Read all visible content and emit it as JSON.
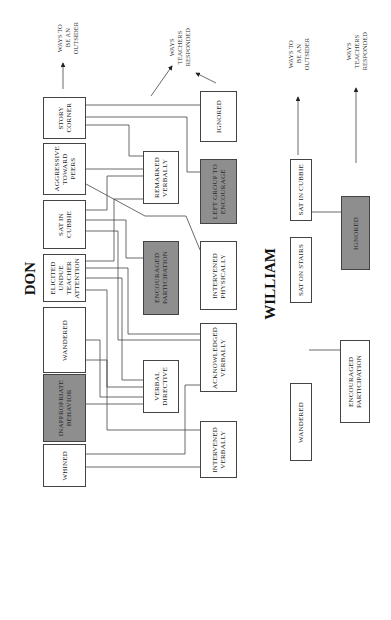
{
  "don": {
    "title": "DON",
    "caption_outsider": "WAYS TO\nBE AN\nOUTSIDER",
    "caption_teachers": "WAYS\nTEACHERS\nRESPONDED",
    "behaviors": [
      {
        "label": "STORY\nCORNER",
        "shaded": false
      },
      {
        "label": "AGGRESSIVE\nTOWARD\nPEERS",
        "shaded": false
      },
      {
        "label": "SAT IN\nCUBBIE",
        "shaded": false
      },
      {
        "label": "ELICITED\nUNDUE\nTEACHER\nATTENTION",
        "shaded": false
      },
      {
        "label": "WANDERED",
        "shaded": false
      },
      {
        "label": "INAPPROPRIATE\nBEHAVIOR",
        "shaded": true
      },
      {
        "label": "WHINED",
        "shaded": false
      }
    ],
    "responses_mid": [
      {
        "label": "REMARKED\nVERBALLY",
        "shaded": false
      },
      {
        "label": "ENCOURAGED\nPARTICIPATION",
        "shaded": true
      },
      {
        "label": "VERBAL\nDIRECTIVE",
        "shaded": false
      }
    ],
    "responses_right": [
      {
        "label": "IGNORED",
        "shaded": false
      },
      {
        "label": "LEFT GROUP TO\nENCOURAGE",
        "shaded": true
      },
      {
        "label": "INTERVENED\nPHYSICALLY",
        "shaded": false
      },
      {
        "label": "ACKNOWLEDGED\nVERBALLY",
        "shaded": false
      },
      {
        "label": "INTERVENED\nVERBALLY",
        "shaded": false
      }
    ]
  },
  "william": {
    "title": "WILLIAM",
    "caption_outsider": "WAYS TO\nBE AN\nOUTSIDER",
    "caption_teachers": "WAYS\nTEACHERS\nRESPONDED",
    "behaviors": [
      {
        "label": "SAT IN CUBBIE",
        "shaded": false
      },
      {
        "label": "SAT ON STAIRS",
        "shaded": false
      },
      {
        "label": "WANDERED",
        "shaded": false
      }
    ],
    "responses": [
      {
        "label": "IGNORED",
        "shaded": true
      },
      {
        "label": "ENCOURAGED\nPARTICIPATION",
        "shaded": false
      }
    ]
  }
}
